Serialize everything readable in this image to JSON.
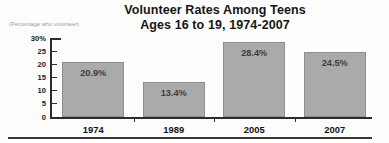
{
  "chart_data": {
    "type": "bar",
    "title": "Volunteer Rates Among Teens",
    "subtitle": "Ages 16 to 19, 1974-2007",
    "axis_note": "(Percentage who volunteer)",
    "categories": [
      "1974",
      "1989",
      "2005",
      "2007"
    ],
    "values": [
      20.9,
      13.4,
      28.4,
      24.5
    ],
    "value_labels": [
      "20.9%",
      "13.4%",
      "28.4%",
      "24.5%"
    ],
    "xlabel": "",
    "ylabel": "",
    "ylim": [
      0,
      30
    ],
    "yticks": [
      0,
      5,
      10,
      15,
      20,
      25,
      30
    ],
    "ytick_labels": [
      "0",
      "5",
      "10",
      "15",
      "20",
      "25",
      "30%"
    ],
    "grid": false,
    "legend": false,
    "bar_color": "#aaaaaa",
    "bar_border_color": "#8e8e8e",
    "axis_color": "#2b2b2b",
    "text_color": "#121212",
    "background_color": "#fdfdfd"
  }
}
